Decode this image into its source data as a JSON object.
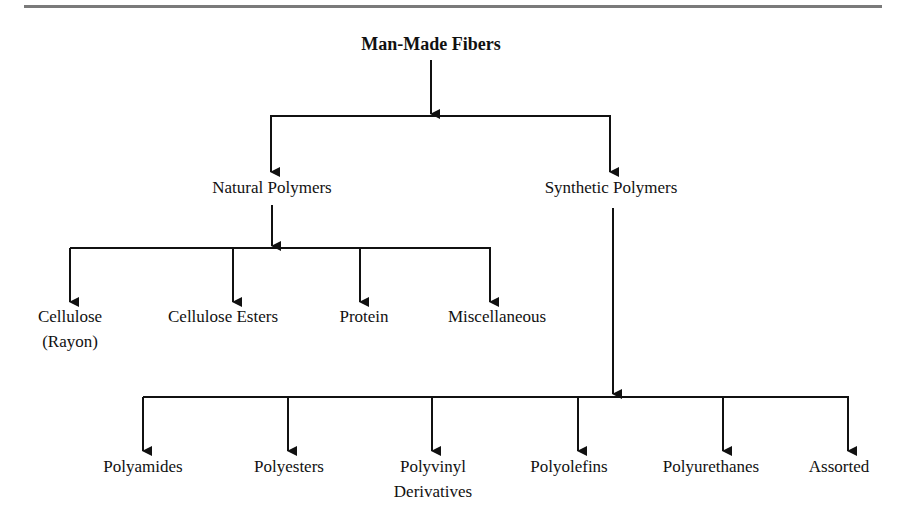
{
  "diagram": {
    "root": "Man-Made Fibers",
    "level1": [
      {
        "label": "Natural Polymers"
      },
      {
        "label": "Synthetic Polymers"
      }
    ],
    "natural_children": [
      {
        "label": "Cellulose",
        "label2": "(Rayon)"
      },
      {
        "label": "Cellulose Esters"
      },
      {
        "label": "Protein"
      },
      {
        "label": "Miscellaneous"
      }
    ],
    "synthetic_children": [
      {
        "label": "Polyamides"
      },
      {
        "label": "Polyesters"
      },
      {
        "label": "Polyvinyl",
        "label2": "Derivatives"
      },
      {
        "label": "Polyolefins"
      },
      {
        "label": "Polyurethanes"
      },
      {
        "label": "Assorted"
      }
    ],
    "colors": {
      "line": "#111111",
      "rule": "#7a7a7a"
    }
  }
}
